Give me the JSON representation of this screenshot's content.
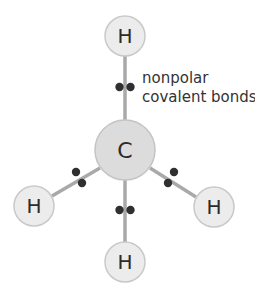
{
  "diagram": {
    "annotation": {
      "line1": "nonpolar",
      "line2": "covalent bonds"
    },
    "atoms": {
      "carbon": {
        "symbol": "C",
        "cx": 125,
        "cy": 150,
        "r": 30
      },
      "h_top": {
        "symbol": "H",
        "cx": 125,
        "cy": 36,
        "r": 20
      },
      "h_left": {
        "symbol": "H",
        "cx": 34,
        "cy": 206,
        "r": 20
      },
      "h_right": {
        "symbol": "H",
        "cx": 214,
        "cy": 207,
        "r": 20
      },
      "h_bottom": {
        "symbol": "H",
        "cx": 125,
        "cy": 262,
        "r": 20
      }
    },
    "bonds": [
      {
        "from": "carbon",
        "to": "h_top",
        "type": "nonpolar covalent",
        "electron_pair": [
          125,
          87
        ]
      },
      {
        "from": "carbon",
        "to": "h_left",
        "type": "nonpolar covalent",
        "electron_pair": [
          79,
          177
        ]
      },
      {
        "from": "carbon",
        "to": "h_right",
        "type": "nonpolar covalent",
        "electron_pair": [
          171,
          178
        ]
      },
      {
        "from": "carbon",
        "to": "h_bottom",
        "type": "nonpolar covalent",
        "electron_pair": [
          125,
          210
        ]
      }
    ],
    "colors": {
      "atom_fill": "#ececec",
      "carbon_fill": "#dcdcdc",
      "atom_stroke": "#c9c9c9",
      "bond": "#a9a9a9",
      "electron": "#2f2f2f",
      "text": "#2b2b2b"
    }
  }
}
